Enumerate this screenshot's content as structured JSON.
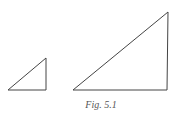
{
  "figure": {
    "caption": "Fig. 5.1",
    "stroke_color": "#444444",
    "triangles": [
      {
        "name": "small",
        "points": [
          [
            8,
            90
          ],
          [
            46,
            90
          ],
          [
            46,
            58
          ]
        ]
      },
      {
        "name": "large",
        "points": [
          [
            73,
            90
          ],
          [
            167,
            90
          ],
          [
            168,
            12
          ]
        ]
      }
    ]
  }
}
